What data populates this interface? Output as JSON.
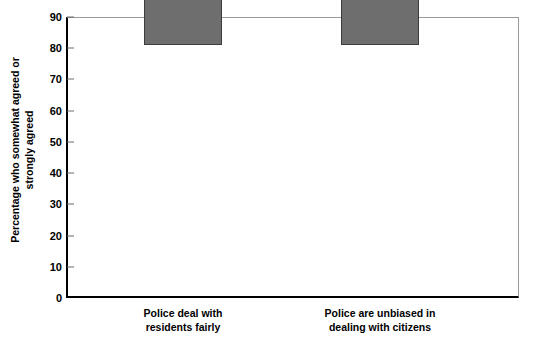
{
  "chart_data": {
    "type": "bar",
    "title": "",
    "subtitle": "",
    "xlabel": "",
    "ylabel": "Percentage who somewhat agreed or strongly agreed",
    "ylabel_lines": [
      "Percentage who somewhat agreed or",
      "strongly agreed"
    ],
    "categories": [
      "Police deal with residents fairly",
      "Police are unbiased in dealing with citizens"
    ],
    "category_lines": [
      [
        "Police deal with",
        "residents fairly"
      ],
      [
        "Police are unbiased in",
        "dealing with citizens"
      ]
    ],
    "values": [
      85,
      64
    ],
    "value_labels": [
      "85",
      "64"
    ],
    "ylim": [
      0,
      90
    ],
    "ytick_values": [
      0,
      10,
      20,
      30,
      40,
      50,
      60,
      70,
      80,
      90
    ],
    "ytick_labels": [
      "0",
      "10",
      "20",
      "30",
      "40",
      "50",
      "60",
      "70",
      "80",
      "90"
    ],
    "grid": false,
    "legend": false,
    "legend_position": "none",
    "bar_color": "#6e6e6e",
    "bar_edge_color": "#3c3c3c",
    "axis_color": "#000000",
    "frame_color": "#9a9a9a",
    "background_color": "#ffffff",
    "text_color": "#000000"
  }
}
